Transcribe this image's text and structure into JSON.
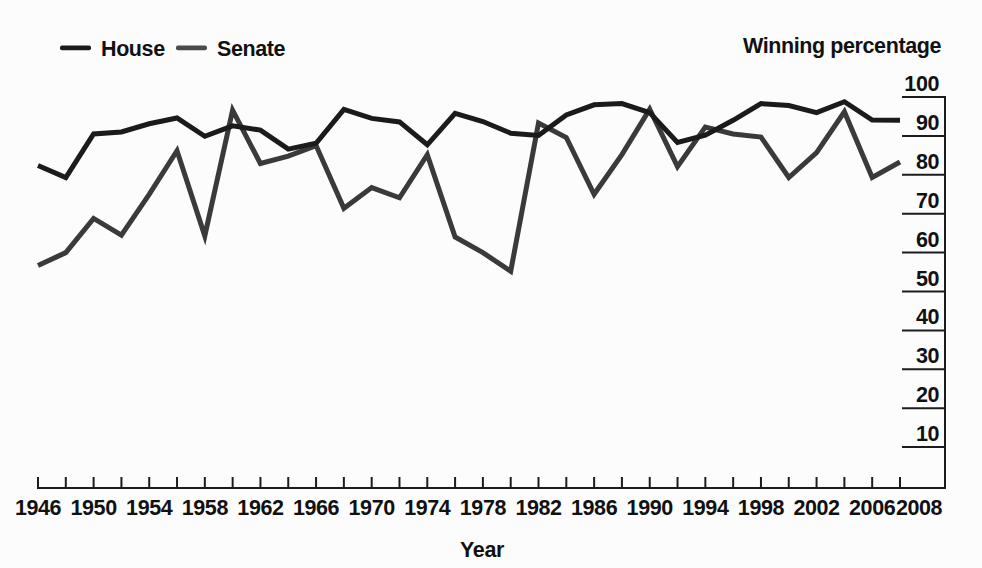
{
  "figure": {
    "background": "#fcfcfc",
    "y_axis_title": "Winning percentage",
    "x_axis_title": "Year",
    "legend": {
      "items": [
        {
          "label": "House",
          "color": "#1b1b1b"
        },
        {
          "label": "Senate",
          "color": "#4a4a4a"
        }
      ]
    }
  },
  "chart_data": {
    "type": "line",
    "title": "",
    "xlabel": "Year",
    "ylabel": "Winning percentage",
    "x": [
      1946,
      1948,
      1950,
      1952,
      1954,
      1956,
      1958,
      1960,
      1962,
      1964,
      1966,
      1968,
      1970,
      1972,
      1974,
      1976,
      1978,
      1980,
      1982,
      1984,
      1986,
      1988,
      1990,
      1992,
      1994,
      1996,
      1998,
      2000,
      2002,
      2004,
      2006,
      2008
    ],
    "series": [
      {
        "name": "House",
        "color": "#1b1b1b",
        "values": [
          82.4,
          79.3,
          90.5,
          91.0,
          93.1,
          94.6,
          89.9,
          92.6,
          91.5,
          86.6,
          88.1,
          96.8,
          94.5,
          93.6,
          87.7,
          95.8,
          93.7,
          90.7,
          90.1,
          95.4,
          98.0,
          98.3,
          96.0,
          88.3,
          90.2,
          94.0,
          98.3,
          97.8,
          96.0,
          98.8,
          94.1,
          94.0
        ]
      },
      {
        "name": "Senate",
        "color": "#3a3a3a",
        "values": [
          56.7,
          60.0,
          68.8,
          64.5,
          75.0,
          86.2,
          64.3,
          96.6,
          82.9,
          84.8,
          87.5,
          71.4,
          76.7,
          74.1,
          85.2,
          64.0,
          60.0,
          55.2,
          93.3,
          89.6,
          75.0,
          85.2,
          96.9,
          82.1,
          92.3,
          90.5,
          89.7,
          79.3,
          85.7,
          96.2,
          79.3,
          83.3
        ]
      }
    ],
    "xlim": [
      1946,
      2008
    ],
    "ylim": [
      0,
      100
    ],
    "y_ticks": [
      100,
      90,
      80,
      70,
      60,
      50,
      40,
      30,
      20,
      10
    ],
    "x_tick_step_years": 2,
    "x_label_years": [
      1946,
      1950,
      1954,
      1958,
      1962,
      1966,
      1970,
      1974,
      1978,
      1982,
      1986,
      1990,
      1994,
      1998,
      2002,
      2006,
      2008
    ],
    "axis_side": "right",
    "grid": false,
    "legend_position": "top-left",
    "line_width": 5,
    "axis_color": "#1c1c1c"
  }
}
